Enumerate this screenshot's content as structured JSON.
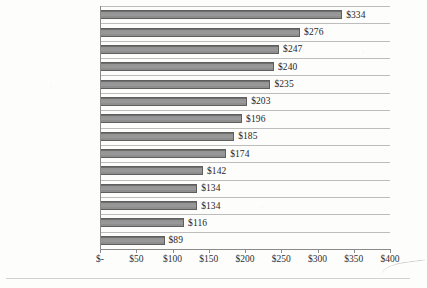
{
  "chart_data": {
    "type": "bar",
    "orientation": "horizontal",
    "title": "",
    "xlabel": "",
    "ylabel": "",
    "xlim": [
      0,
      400
    ],
    "grid": true,
    "legend": "none",
    "categories": [
      "Communications",
      "Pharmaceutical",
      "Financial",
      "Healthcare",
      "Industrial",
      "Consumer",
      "Transportation",
      "Services",
      "Retail",
      "Education",
      "Technology",
      "Public",
      "Hospitality",
      "Media"
    ],
    "values": [
      334,
      276,
      247,
      240,
      235,
      203,
      196,
      185,
      174,
      142,
      134,
      134,
      116,
      89
    ],
    "data_labels": [
      "$334",
      "$276",
      "$247",
      "$240",
      "$235",
      "$203",
      "$196",
      "$185",
      "$174",
      "$142",
      "$134",
      "$134",
      "$116",
      "$89"
    ],
    "xticks": [
      0,
      50,
      100,
      150,
      200,
      250,
      300,
      350,
      400
    ],
    "xtick_labels": [
      "$-",
      "$50",
      "$100",
      "$150",
      "$200",
      "$250",
      "$300",
      "$350",
      "$400"
    ],
    "colors": {
      "bar_fill": "#949494",
      "bar_edge": "#5f5f5f",
      "gridline": "#bdbdbd",
      "axis": "#8a8a8a",
      "text": "#2f2f2f",
      "background": "#fdfdfc"
    }
  }
}
